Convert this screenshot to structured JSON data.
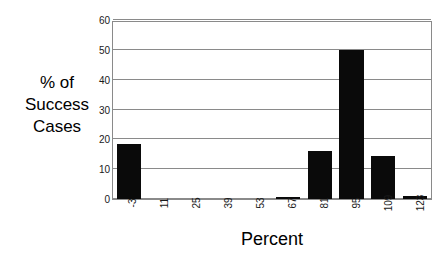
{
  "chart_data": {
    "type": "bar",
    "title": "",
    "xlabel": "Percent",
    "ylabel": "% of Success Cases",
    "ylabel_lines": [
      "% of",
      "Success",
      "Cases"
    ],
    "categories": [
      "-3",
      "11",
      "25",
      "39",
      "53",
      "67",
      "81",
      "95",
      "109",
      "123"
    ],
    "values": [
      18.5,
      0,
      0,
      0,
      0,
      0.7,
      16,
      50,
      14.5,
      1
    ],
    "ylim": [
      0,
      60
    ],
    "yticks": [
      "0",
      "10",
      "20",
      "30",
      "40",
      "50",
      "60"
    ],
    "ytick_values": [
      0,
      10,
      20,
      30,
      40,
      50,
      60
    ],
    "grid": "horizontal",
    "legend": "none",
    "bar_color": "#0a0a0a",
    "grid_color": "#8a8a8a",
    "background_color": "#ffffff",
    "xtick_rotation": "90"
  }
}
